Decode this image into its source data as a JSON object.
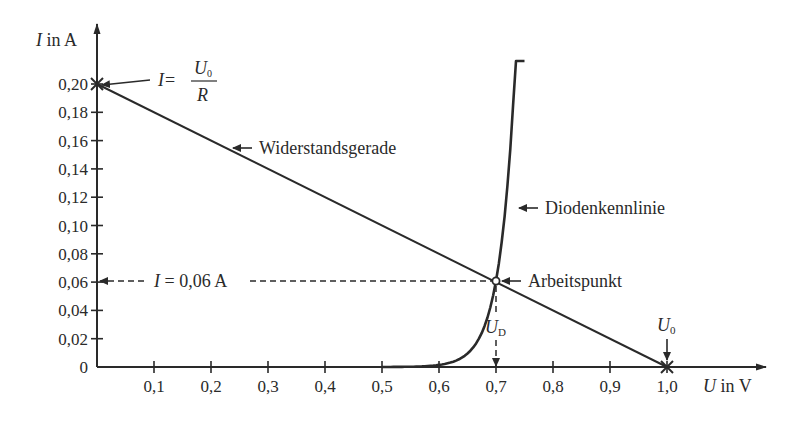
{
  "chart_data": {
    "type": "line",
    "title": "",
    "xlabel": {
      "symbol": "U",
      "unit": "in V"
    },
    "ylabel": {
      "symbol": "I",
      "unit": "in A"
    },
    "xlim": [
      0,
      1.0
    ],
    "ylim": [
      0,
      0.2
    ],
    "grid": false,
    "x_ticks": [
      "0,1",
      "0,2",
      "0,3",
      "0,4",
      "0,5",
      "0,6",
      "0,7",
      "0,8",
      "0,9",
      "1,0"
    ],
    "x_tick_values": [
      0.1,
      0.2,
      0.3,
      0.4,
      0.5,
      0.6,
      0.7,
      0.8,
      0.9,
      1.0
    ],
    "y_ticks": [
      "0",
      "0,02",
      "0,04",
      "0,06",
      "0,08",
      "0,10",
      "0,12",
      "0,14",
      "0,16",
      "0,18",
      "0,20"
    ],
    "y_tick_values": [
      0,
      0.02,
      0.04,
      0.06,
      0.08,
      0.1,
      0.12,
      0.14,
      0.16,
      0.18,
      0.2
    ],
    "series": [
      {
        "name": "Widerstandsgerade",
        "x": [
          0,
          1.0
        ],
        "y": [
          0.2,
          0
        ]
      },
      {
        "name": "Diodenkennlinie",
        "x": [
          0.5,
          0.55,
          0.6,
          0.65,
          0.67,
          0.7,
          0.72,
          0.74,
          0.75
        ],
        "y": [
          0.0,
          0.002,
          0.006,
          0.02,
          0.034,
          0.061,
          0.1,
          0.17,
          0.22
        ]
      }
    ],
    "annotations": [
      {
        "text_lhs": "I =",
        "numerator": "U",
        "numerator_sub": "0",
        "denominator": "R",
        "points_to": [
          0,
          0.2
        ]
      },
      {
        "text": "Widerstandsgerade",
        "points_to": "resistance line"
      },
      {
        "text": "Diodenkennlinie",
        "points_to": "diode curve"
      },
      {
        "text": "Arbeitspunkt",
        "points_to": [
          0.7,
          0.06
        ]
      },
      {
        "text": "I = 0,06 A",
        "points_to": [
          0,
          0.06
        ]
      },
      {
        "symbol": "U",
        "sub": "D",
        "points_to": [
          0.7,
          0
        ]
      },
      {
        "symbol": "U",
        "sub": "0",
        "points_to": [
          1.0,
          0
        ]
      }
    ]
  },
  "labels": {
    "y_axis_symbol": "I",
    "y_axis_unit": " in A",
    "x_axis_symbol": "U",
    "x_axis_unit": " in V",
    "formula_lhs": "I",
    "formula_eq": " =",
    "formula_num": "U",
    "formula_num_sub": "0",
    "formula_den": "R",
    "resistance_line": "Widerstandsgerade",
    "diode_curve": "Diodenkennlinie",
    "operating_point": "Arbeitspunkt",
    "current_lhs": "I",
    "current_rhs": " = 0,06 A",
    "ud_symbol": "U",
    "ud_sub": "D",
    "u0_symbol": "U",
    "u0_sub": "0"
  }
}
